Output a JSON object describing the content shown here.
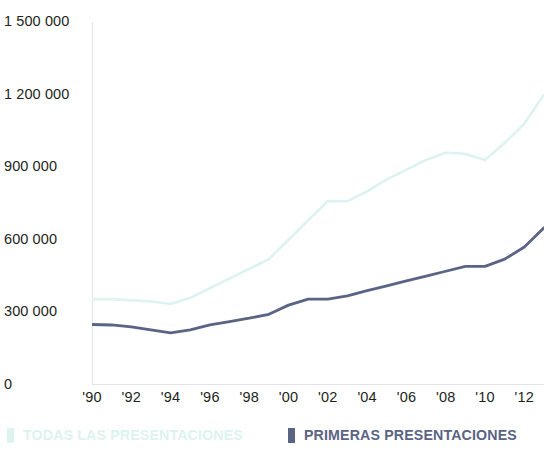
{
  "chart_data": {
    "type": "line",
    "title": "",
    "subtitle": "",
    "xlabel": "",
    "ylabel": "",
    "grid": false,
    "legend_position": "bottom",
    "xlim": [
      1990,
      2013
    ],
    "ylim": [
      0,
      1500000
    ],
    "y_ticks": [
      0,
      300000,
      600000,
      900000,
      1200000,
      1500000
    ],
    "y_tick_labels": [
      "0",
      "300 000",
      "600 000",
      "900 000",
      "1 200 000",
      "1 500 000"
    ],
    "x_ticks": [
      1990,
      1992,
      1994,
      1996,
      1998,
      2000,
      2002,
      2004,
      2006,
      2008,
      2010,
      2012
    ],
    "x_tick_labels": [
      "'90",
      "'92",
      "'94",
      "'96",
      "'98",
      "'00",
      "'02",
      "'04",
      "'06",
      "'08",
      "'10",
      "'12"
    ],
    "x": [
      1990,
      1991,
      1992,
      1993,
      1994,
      1995,
      1996,
      1997,
      1998,
      1999,
      2000,
      2001,
      2002,
      2003,
      2004,
      2005,
      2006,
      2007,
      2008,
      2009,
      2010,
      2011,
      2012,
      2013
    ],
    "series": [
      {
        "name": "TODAS LAS PRESENTACIONES",
        "color": "#ddf3f1",
        "values": [
          355000,
          355000,
          350000,
          345000,
          335000,
          360000,
          400000,
          440000,
          480000,
          520000,
          600000,
          680000,
          760000,
          760000,
          800000,
          850000,
          890000,
          930000,
          960000,
          955000,
          930000,
          1000000,
          1080000,
          1200000
        ]
      },
      {
        "name": "PRIMERAS PRESENTACIONES",
        "color": "#5a6484",
        "values": [
          250000,
          248000,
          240000,
          228000,
          215000,
          228000,
          248000,
          262000,
          276000,
          292000,
          330000,
          355000,
          355000,
          368000,
          390000,
          410000,
          430000,
          450000,
          470000,
          490000,
          490000,
          520000,
          570000,
          650000
        ]
      }
    ]
  },
  "legend": {
    "entries": [
      {
        "label": "TODAS LAS PRESENTACIONES",
        "color": "#ddf3f1"
      },
      {
        "label": "PRIMERAS PRESENTACIONES",
        "color": "#5a6484"
      }
    ],
    "all_label": "TODAS LAS PRESENTACIONES",
    "first_label": "PRIMERAS PRESENTACIONES"
  }
}
